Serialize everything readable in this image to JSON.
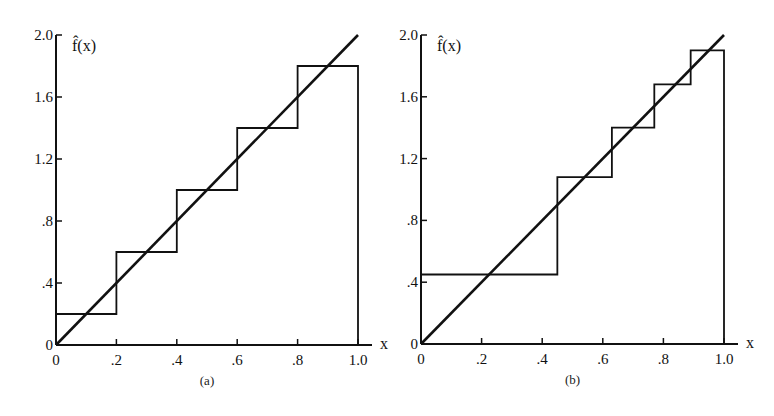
{
  "chart_data": [
    {
      "id": "a",
      "type": "line",
      "caption": "(a)",
      "title": "",
      "xlabel": "x",
      "ylabel": "f̂(x)",
      "xlim": [
        0,
        1.0
      ],
      "ylim": [
        0,
        2.0
      ],
      "grid": false,
      "x_ticks": [
        0,
        0.2,
        0.4,
        0.6,
        0.8,
        1.0
      ],
      "x_tick_labels": [
        "0",
        ".2",
        ".4",
        ".6",
        ".8",
        "1.0"
      ],
      "y_ticks": [
        0,
        0.4,
        0.8,
        1.2,
        1.6,
        2.0
      ],
      "y_tick_labels": [
        "0",
        ".4",
        ".8",
        "1.2",
        "1.6",
        "2.0"
      ],
      "series": [
        {
          "name": "true density f(x) = 2x",
          "kind": "line",
          "x": [
            0,
            1.0
          ],
          "y": [
            0,
            2.0
          ]
        },
        {
          "name": "histogram estimate (equal-width bins)",
          "kind": "step",
          "bin_edges": [
            0,
            0.2,
            0.4,
            0.6,
            0.8,
            1.0
          ],
          "values": [
            0.2,
            0.6,
            1.0,
            1.4,
            1.8
          ]
        }
      ]
    },
    {
      "id": "b",
      "type": "line",
      "caption": "(b)",
      "title": "",
      "xlabel": "x",
      "ylabel": "f̂(x)",
      "xlim": [
        0,
        1.0
      ],
      "ylim": [
        0,
        2.0
      ],
      "grid": false,
      "x_ticks": [
        0,
        0.2,
        0.4,
        0.6,
        0.8,
        1.0
      ],
      "x_tick_labels": [
        "0",
        ".2",
        ".4",
        ".6",
        ".8",
        "1.0"
      ],
      "y_ticks": [
        0,
        0.4,
        0.8,
        1.2,
        1.6,
        2.0
      ],
      "y_tick_labels": [
        "0",
        ".4",
        ".8",
        "1.2",
        "1.6",
        "2.0"
      ],
      "series": [
        {
          "name": "true density f(x) = 2x",
          "kind": "line",
          "x": [
            0,
            1.0
          ],
          "y": [
            0,
            2.0
          ]
        },
        {
          "name": "histogram estimate (equal-probability bins)",
          "kind": "step",
          "bin_edges": [
            0,
            0.45,
            0.63,
            0.77,
            0.89,
            1.0
          ],
          "values": [
            0.45,
            1.08,
            1.4,
            1.68,
            1.9
          ]
        }
      ]
    }
  ],
  "panels": [
    {
      "caption": "(a)",
      "xlabel": "x",
      "ylabel": "f̂(x)"
    },
    {
      "caption": "(b)",
      "xlabel": "x",
      "ylabel": "f̂(x)"
    }
  ],
  "style": {
    "ink": "#111111",
    "background": "#ffffff"
  }
}
